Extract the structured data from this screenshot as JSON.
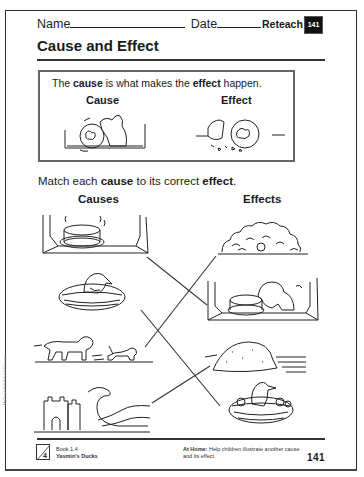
{
  "header": {
    "name_label": "Name",
    "date_label": "Date",
    "reteach_label": "Reteach",
    "page_badge": "141"
  },
  "title": "Cause and Effect",
  "definition_box": {
    "sentence_parts": [
      "The ",
      "cause",
      " is what makes the ",
      "effect",
      " happen."
    ],
    "cause_label": "Cause",
    "effect_label": "Effect",
    "cause_icon": "cat-knocking-jar-icon",
    "effect_icon": "broken-jar-icon"
  },
  "instructions": {
    "parts": [
      "Match each ",
      "cause",
      " to its correct ",
      "effect",
      "."
    ]
  },
  "columns": {
    "causes_header": "Causes",
    "effects_header": "Effects"
  },
  "causes": [
    {
      "id": "c1",
      "icon": "cake-on-windowsill-icon",
      "description": "Cake cooling on windowsill"
    },
    {
      "id": "c2",
      "icon": "bird-on-nest-icon",
      "description": "Bird sitting on nest"
    },
    {
      "id": "c3",
      "icon": "dog-chasing-cat-icon",
      "description": "Dog chasing cat"
    },
    {
      "id": "c4",
      "icon": "wave-hitting-sandcastle-icon",
      "description": "Wave hitting sandcastle"
    }
  ],
  "effects": [
    {
      "id": "e1",
      "icon": "cat-hiding-in-bush-icon",
      "description": "Cat hiding in bush"
    },
    {
      "id": "e2",
      "icon": "dog-eating-cake-icon",
      "description": "Dog eating cake on windowsill"
    },
    {
      "id": "e3",
      "icon": "sand-mound-icon",
      "description": "Sand mound on beach"
    },
    {
      "id": "e4",
      "icon": "bird-with-chicks-icon",
      "description": "Bird with chicks in nest"
    }
  ],
  "matches": [
    {
      "cause": "c1",
      "effect": "e2"
    },
    {
      "cause": "c2",
      "effect": "e4"
    },
    {
      "cause": "c3",
      "effect": "e1"
    },
    {
      "cause": "c4",
      "effect": "e3"
    }
  ],
  "footer": {
    "unit_number": "4",
    "book": "Book 1.4",
    "story": "Yasmin's Ducks",
    "at_home_label": "At Home:",
    "at_home_text": " Help children illustrate another cause and its effect.",
    "page_number": "141"
  },
  "side_credit": "McGraw-Hill School Division"
}
